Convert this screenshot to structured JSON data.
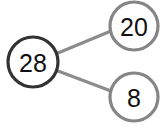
{
  "diagram": {
    "type": "number-bond",
    "colors": {
      "whole_stroke": "#333333",
      "part_stroke": "#858585",
      "connector": "#8c8c8c",
      "text": "#111111",
      "background": "#ffffff"
    },
    "whole": {
      "label": "28",
      "cx": 33,
      "cy": 62,
      "r": 25
    },
    "parts": [
      {
        "label": "20",
        "cx": 134,
        "cy": 26,
        "r": 24
      },
      {
        "label": "8",
        "cx": 134,
        "cy": 97,
        "r": 24
      }
    ],
    "connectors": [
      {
        "x1": 58,
        "y1": 53,
        "x2": 111,
        "y2": 31
      },
      {
        "x1": 58,
        "y1": 71,
        "x2": 111,
        "y2": 91
      }
    ]
  }
}
